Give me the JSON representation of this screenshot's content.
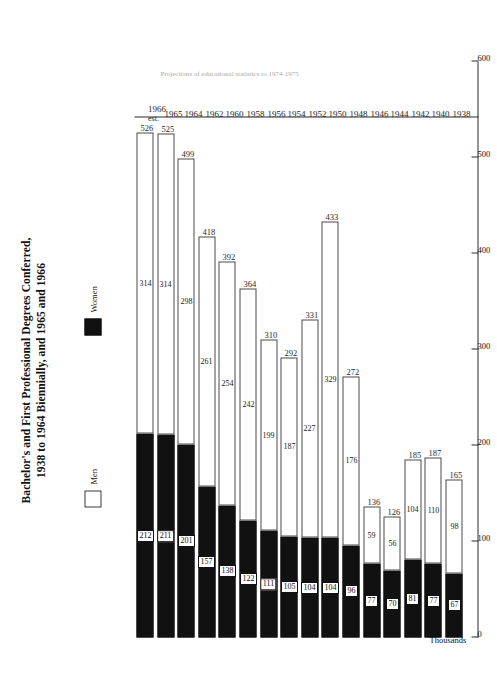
{
  "figure": {
    "title_lines": [
      "Bachelor's and First Professional Degrees Conferred,",
      "1938 to 1964 Biennially, and 1965 and 1966"
    ],
    "axis_units": "Thousands",
    "footnote": "Projections of educational statistics to 1974-1975"
  },
  "legend": {
    "men_label": "Men",
    "women_label": "Women",
    "men_color": "#ffffff",
    "women_color": "#111111"
  },
  "chart_data": {
    "type": "bar",
    "orientation": "horizontal-stacked",
    "title": "Bachelor's and First Professional Degrees Conferred, 1938 to 1964 Biennially, and 1965 and 1966",
    "xlabel": "Thousands",
    "ylabel": "",
    "xlim": [
      0,
      600
    ],
    "xticks": [
      0,
      100,
      200,
      300,
      400,
      500,
      600
    ],
    "xtick_labels": [
      "0",
      "100",
      "200",
      "300",
      "400",
      "500",
      "600"
    ],
    "grid": false,
    "legend_position": "top-left",
    "categories": [
      "1938",
      "1940",
      "1942",
      "1944",
      "1946",
      "1948",
      "1950",
      "1952",
      "1954",
      "1956",
      "1958",
      "1960",
      "1962",
      "1964",
      "1965",
      "1966"
    ],
    "category_notes": [
      "",
      "",
      "",
      "",
      "",
      "",
      "",
      "",
      "",
      "",
      "",
      "",
      "",
      "",
      "",
      "est."
    ],
    "series": [
      {
        "name": "Women",
        "values": [
          67,
          77,
          81,
          70,
          77,
          96,
          104,
          104,
          105,
          111,
          122,
          138,
          157,
          201,
          211,
          212
        ]
      },
      {
        "name": "Men",
        "values": [
          98,
          110,
          104,
          56,
          59,
          176,
          329,
          227,
          187,
          199,
          242,
          254,
          261,
          298,
          314,
          314
        ]
      }
    ],
    "totals": [
      165,
      187,
      185,
      126,
      136,
      272,
      433,
      331,
      292,
      310,
      364,
      392,
      418,
      499,
      525,
      526
    ]
  }
}
